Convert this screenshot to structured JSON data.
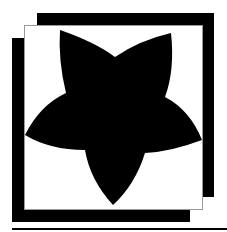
{
  "icon": {
    "name": "star-framed-icon",
    "colors": {
      "fill": "#000000",
      "background": "#ffffff",
      "frame_border": "#9a9a9a"
    }
  }
}
